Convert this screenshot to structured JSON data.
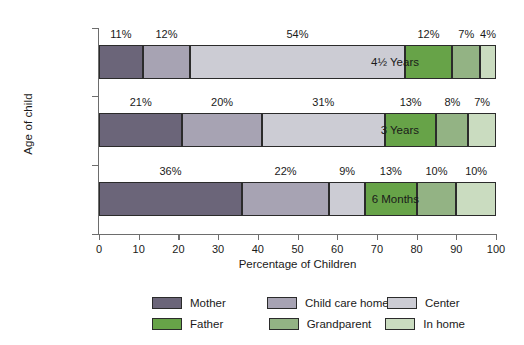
{
  "chart_data": {
    "type": "bar",
    "orientation": "horizontal",
    "stacked": true,
    "stack_total": 100,
    "title": "",
    "xlabel": "Percentage of Children",
    "ylabel": "Age of child",
    "xlim": [
      0,
      100
    ],
    "xticks": [
      0,
      10,
      20,
      30,
      40,
      50,
      60,
      70,
      80,
      90,
      100
    ],
    "xtick_labels": [
      "0",
      "10",
      "20",
      "30",
      "40",
      "50",
      "60",
      "70",
      "80",
      "90",
      "100"
    ],
    "grid": false,
    "legend_position": "bottom",
    "categories": [
      "4½ Years",
      "3 Years",
      "6 Months"
    ],
    "series": [
      {
        "name": "Mother",
        "color": "#6b6579",
        "values": [
          11,
          21,
          36
        ]
      },
      {
        "name": "Child care home",
        "color": "#a7a3b3",
        "values": [
          12,
          20,
          22
        ]
      },
      {
        "name": "Center",
        "color": "#ccccd4",
        "values": [
          54,
          31,
          9
        ]
      },
      {
        "name": "Father",
        "color": "#67a348",
        "values": [
          12,
          13,
          13
        ]
      },
      {
        "name": "Grandparent",
        "color": "#93b384",
        "values": [
          7,
          8,
          10
        ]
      },
      {
        "name": "In home",
        "color": "#cadcc0",
        "values": [
          4,
          7,
          10
        ]
      }
    ],
    "data_labels": {
      "4½ Years": [
        "11%",
        "12%",
        "54%",
        "12%",
        "7%",
        "4%"
      ],
      "3 Years": [
        "21%",
        "20%",
        "31%",
        "13%",
        "8%",
        "7%"
      ],
      "6 Months": [
        "36%",
        "22%",
        "9%",
        "13%",
        "10%",
        "10%"
      ]
    },
    "legend_entries": [
      {
        "label": "Mother",
        "color": "#6b6579"
      },
      {
        "label": "Child care home",
        "color": "#a7a3b3"
      },
      {
        "label": "Center",
        "color": "#ccccd4"
      },
      {
        "label": "Father",
        "color": "#67a348"
      },
      {
        "label": "Grandparent",
        "color": "#93b384"
      },
      {
        "label": "In home",
        "color": "#cadcc0"
      }
    ]
  },
  "colors": {
    "axis": "#6d6d6d",
    "segment_border": "#2b2b2b",
    "text": "#1a1a1a",
    "background": "#ffffff"
  }
}
